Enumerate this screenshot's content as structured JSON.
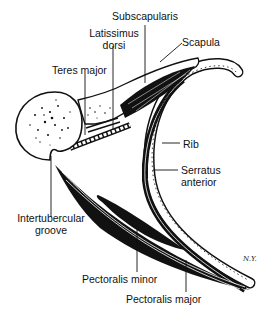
{
  "figure": {
    "signature": "N.Y."
  },
  "labels": {
    "subscapularis": "Subscapularis",
    "latissimus_line1": "Latissimus",
    "latissimus_line2": "dorsi",
    "scapula": "Scapula",
    "teres_major": "Teres major",
    "rib": "Rib",
    "serratus_line1": "Serratus",
    "serratus_line2": "anterior",
    "intertubercular_line1": "Intertubercular",
    "intertubercular_line2": "groove",
    "pectoralis_minor": "Pectoralis minor",
    "pectoralis_major": "Pectoralis major"
  },
  "colors": {
    "ink": "#111111",
    "background": "#ffffff"
  }
}
